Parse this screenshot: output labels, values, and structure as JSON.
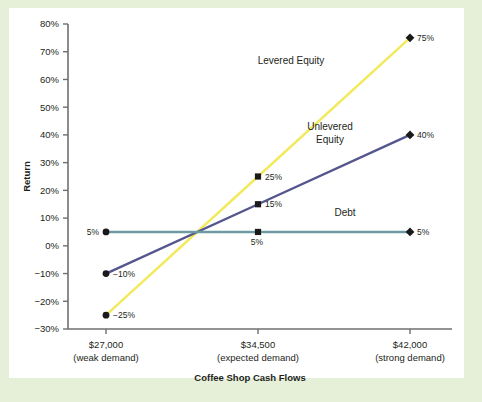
{
  "figure": {
    "background_color": "#e6efd8",
    "plate_color": "#ffffff"
  },
  "chart_data": {
    "type": "line",
    "title": "",
    "xlabel": "Coffee Shop Cash Flows",
    "ylabel": "Return",
    "categories": [
      "$27,000",
      "$34,500",
      "$42,000"
    ],
    "category_sublabels": [
      "(weak demand)",
      "(expected demand)",
      "(strong demand)"
    ],
    "x": [
      27000,
      34500,
      42000
    ],
    "ylim": [
      -30,
      80
    ],
    "ytick_labels": [
      "80%",
      "70%",
      "60%",
      "50%",
      "40%",
      "30%",
      "20%",
      "10%",
      "0%",
      "−10%",
      "−20%",
      "−30%"
    ],
    "ytick_values": [
      80,
      70,
      60,
      50,
      40,
      30,
      20,
      10,
      0,
      -10,
      -20,
      -30
    ],
    "grid": false,
    "legend_position": "inline-annotations",
    "series": [
      {
        "name": "Levered Equity",
        "color": "#f2ea5a",
        "values": [
          -25,
          25,
          75
        ],
        "point_labels": [
          "−25%",
          "25%",
          "75%"
        ],
        "label_sides": [
          "right",
          "right",
          "right"
        ],
        "markers": [
          "circle",
          "square",
          "diamond"
        ]
      },
      {
        "name": "Unlevered Equity",
        "color": "#56568f",
        "values": [
          -10,
          15,
          40
        ],
        "point_labels": [
          "−10%",
          "15%",
          "40%"
        ],
        "label_sides": [
          "right",
          "right",
          "right"
        ],
        "markers": [
          "circle",
          "square",
          "diamond"
        ]
      },
      {
        "name": "Debt",
        "color": "#6c9ca2",
        "values": [
          5,
          5,
          5
        ],
        "point_labels": [
          "5%",
          "5%",
          "5%"
        ],
        "label_sides": [
          "left",
          "below",
          "right"
        ],
        "markers": [
          "circle",
          "square",
          "diamond"
        ]
      }
    ],
    "annotations": [
      {
        "text": "Levered Equity",
        "x_px": 291,
        "y_px": 64,
        "lines": [
          "Levered Equity"
        ]
      },
      {
        "text": "Unlevered Equity",
        "x_px": 330,
        "y_px": 130,
        "lines": [
          "Unlevered",
          "Equity"
        ]
      },
      {
        "text": "Debt",
        "x_px": 345,
        "y_px": 216,
        "lines": [
          "Debt"
        ]
      }
    ],
    "axis_color": "#6f6f6f",
    "marker_color": "#1a1a1a"
  }
}
